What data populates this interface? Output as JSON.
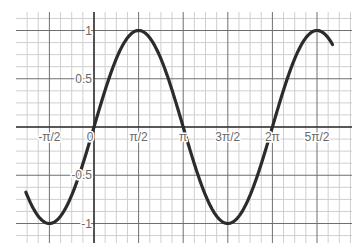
{
  "chart_data": {
    "type": "line",
    "title": "",
    "xlabel": "",
    "ylabel": "",
    "function": "y = sin(x)",
    "grid": true,
    "legend": null,
    "xlim_radians": [
      -2.4,
      5.12
    ],
    "ylim": [
      -1.25,
      1.25
    ],
    "x_ticks": [
      {
        "label": "-π/2",
        "value": -1.5708
      },
      {
        "label": "0",
        "value": 0
      },
      {
        "label": "π/2",
        "value": 1.5708
      },
      {
        "label": "π",
        "value": 3.1416
      },
      {
        "label": "3π/2",
        "value": 4.7124
      },
      {
        "label": "2π",
        "value": 6.2832
      },
      {
        "label": "5π/2",
        "value": 7.854
      }
    ],
    "y_ticks": [
      {
        "label": "1",
        "value": 1
      },
      {
        "label": "0.5",
        "value": 0.5
      },
      {
        "label": "-0.5",
        "value": -0.5
      },
      {
        "label": "-1",
        "value": -1
      }
    ],
    "series": [
      {
        "name": "sin(x)",
        "x_labels": [
          "-π",
          "-3π/4",
          "-π/2",
          "-π/4",
          "0",
          "π/4",
          "π/2",
          "3π/4",
          "π",
          "5π/4",
          "3π/2",
          "7π/4",
          "2π",
          "9π/4",
          "5π/2",
          "11π/4"
        ],
        "x": [
          -3.1416,
          -2.3562,
          -1.5708,
          -0.7854,
          0,
          0.7854,
          1.5708,
          2.3562,
          3.1416,
          3.927,
          4.7124,
          5.4978,
          6.2832,
          7.0686,
          7.854,
          8.6394
        ],
        "y": [
          0,
          -0.7071,
          -1,
          -0.7071,
          0,
          0.7071,
          1,
          0.7071,
          0,
          -0.7071,
          -1,
          -0.7071,
          0,
          0.7071,
          1,
          0.7071
        ]
      }
    ],
    "visible_x_range_radians": [
      -2.4,
      8.4
    ],
    "colors": {
      "curve": "#2b2b2b",
      "major_grid": "#6f6f6f",
      "minor_grid": "#cfcfcf",
      "axis": "#3a3a3a",
      "label": "#6a6a6a"
    }
  }
}
